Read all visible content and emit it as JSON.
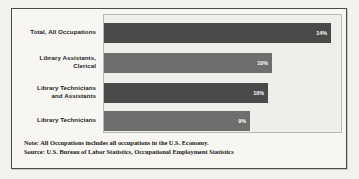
{
  "chart_data": {
    "type": "bar",
    "orientation": "horizontal",
    "title": "",
    "subtitle": "",
    "xlabel": "",
    "ylabel": "",
    "grid": false,
    "legend": "none",
    "xlim": [
      0,
      16
    ],
    "value_suffix": "%",
    "categories": [
      "Total, All Occupations",
      "Library Assistants, Clerical",
      "Library Technicians and Assistants",
      "Library Technicians"
    ],
    "values": [
      14,
      10,
      10,
      9
    ],
    "value_labels": [
      "14%",
      "10%",
      "10%",
      "9%"
    ],
    "bar_colors": [
      "#4a4a4a",
      "#6e6e6e",
      "#4a4a4a",
      "#6e6e6e"
    ],
    "annotations": [
      "Note: All Occupations includes all occupations in the U.S. Economy.",
      "Source: U.S. Bureau of Labor Statistics, Occupational Employment Statistics"
    ]
  },
  "bars": [
    {
      "label_line1": "Total, All Occupations",
      "label_line2": "",
      "value_label": "14%",
      "color": "#4a4a4a",
      "width_px": 227,
      "top_px": 8,
      "label_top_px": 14
    },
    {
      "label_line1": "Library Assistants,",
      "label_line2": "Clerical",
      "value_label": "10%",
      "color": "#6e6e6e",
      "width_px": 168,
      "top_px": 38,
      "label_top_px": 40
    },
    {
      "label_line1": "Library Technicians",
      "label_line2": "and Assistants",
      "value_label": "10%",
      "color": "#4a4a4a",
      "width_px": 164,
      "top_px": 68,
      "label_top_px": 70
    },
    {
      "label_line1": "Library Technicians",
      "label_line2": "",
      "value_label": "9%",
      "color": "#6e6e6e",
      "width_px": 146,
      "top_px": 96,
      "label_top_px": 102
    }
  ],
  "footnote": {
    "note": "Note: All Occupations includes all occupations in the U.S. Economy.",
    "source": "Source: U.S. Bureau of Labor Statistics, Occupational Employment Statistics"
  },
  "colors": {
    "page_background": "#f2f1ee",
    "frame_background": "#f7f6f3",
    "plot_background": "#efeeea",
    "frame_border": "#4b4b4b",
    "plot_border": "#b9b7b2",
    "bar_dark": "#4a4a4a",
    "bar_medium": "#6e6e6e",
    "value_text": "#ffffff",
    "label_text": "#1d1d1d"
  }
}
